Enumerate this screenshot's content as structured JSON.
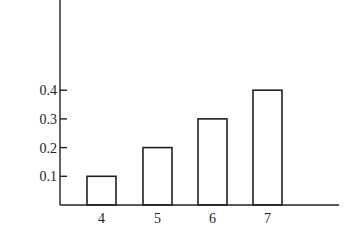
{
  "chart_data": {
    "type": "bar",
    "title": "",
    "xlabel": "",
    "ylabel": "",
    "categories": [
      "4",
      "5",
      "6",
      "7"
    ],
    "values": [
      0.1,
      0.2,
      0.3,
      0.4
    ],
    "yticks": [
      "0.1",
      "0.2",
      "0.3",
      "0.4"
    ],
    "ylim": [
      0,
      0.7
    ],
    "grid": false,
    "legend": null,
    "bar_style": "outline",
    "colors": {
      "stroke": "#222222",
      "fill": "#ffffff"
    }
  },
  "layout": {
    "axis_x": 60,
    "baseline_y": 205,
    "axis_top": 0,
    "axis_right": 339,
    "px_per_unit": 287,
    "bar_width": 29,
    "bar_lefts": [
      87,
      143,
      198,
      253
    ],
    "tick_len": 7
  }
}
